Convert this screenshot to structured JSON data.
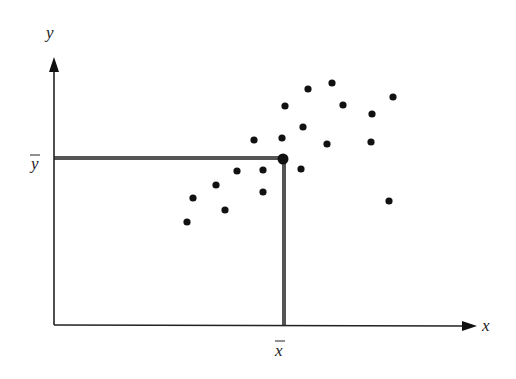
{
  "diagram": {
    "type": "scatter",
    "axis_labels": {
      "x": "x",
      "y": "y"
    },
    "mean_labels": {
      "x_bar": "x",
      "y_bar": "y"
    },
    "colors": {
      "axis": "#222222",
      "mean_lines": "#555555",
      "points": "#111111",
      "background": "#ffffff"
    }
  },
  "chart_data": {
    "type": "scatter",
    "title": "",
    "xlabel": "x",
    "ylabel": "y",
    "annotations": [
      "x̄ (mean of x) with vertical line",
      "ȳ (mean of y) with horizontal line",
      "mean point (x̄, ȳ) highlighted"
    ],
    "grid": false,
    "points_px": [
      [
        308,
        89
      ],
      [
        332,
        83
      ],
      [
        393,
        97
      ],
      [
        285,
        106
      ],
      [
        343,
        105
      ],
      [
        372,
        114
      ],
      [
        303,
        127
      ],
      [
        254,
        140
      ],
      [
        282,
        138
      ],
      [
        327,
        144
      ],
      [
        371,
        142
      ],
      [
        237,
        171
      ],
      [
        263,
        170
      ],
      [
        301,
        169
      ],
      [
        216,
        185
      ],
      [
        193,
        198
      ],
      [
        263,
        192
      ],
      [
        225,
        210
      ],
      [
        187,
        222
      ],
      [
        389,
        201
      ]
    ],
    "mean_point_px": [
      283,
      159
    ]
  }
}
